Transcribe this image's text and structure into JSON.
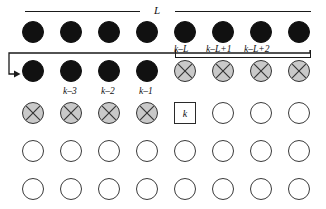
{
  "figure": {
    "name": "sequential-lattice-diagram",
    "grid": {
      "columns": 8,
      "rows": 5,
      "col_x": [
        33,
        71,
        109,
        147,
        185,
        223,
        261,
        299
      ],
      "row_y": [
        32,
        71,
        113,
        151,
        189
      ],
      "node_diameter": 22
    },
    "node_states": [
      [
        "filled",
        "filled",
        "filled",
        "filled",
        "filled",
        "filled",
        "filled",
        "filled"
      ],
      [
        "filled",
        "filled",
        "filled",
        "filled",
        "crossed",
        "crossed",
        "crossed",
        "crossed"
      ],
      [
        "crossed",
        "crossed",
        "crossed",
        "crossed",
        "current",
        "empty",
        "empty",
        "empty"
      ],
      [
        "empty",
        "empty",
        "empty",
        "empty",
        "empty",
        "empty",
        "empty",
        "empty"
      ],
      [
        "empty",
        "empty",
        "empty",
        "empty",
        "empty",
        "empty",
        "empty",
        "empty"
      ]
    ],
    "legend": {
      "filled": "processed-site",
      "crossed": "in-window-site",
      "empty": "unprocessed-site",
      "current": "current-site-k"
    }
  },
  "span_label": {
    "text": "L",
    "description": "window-length-brace-top"
  },
  "top_labels": [
    {
      "text": "k–L",
      "x": 185,
      "y": 49
    },
    {
      "text": "k–L+1",
      "x": 223,
      "y": 49
    },
    {
      "text": "k–L+2",
      "x": 261,
      "y": 49
    }
  ],
  "mid_labels": [
    {
      "text": "k–3",
      "x": 71,
      "y": 91
    },
    {
      "text": "k–2",
      "x": 109,
      "y": 91
    },
    {
      "text": "k–1",
      "x": 147,
      "y": 91
    }
  ],
  "current_cell": {
    "text": "k",
    "x": 185,
    "y": 113
  },
  "colors": {
    "filled": "#111111",
    "crossed_fill": "#c9c9c9",
    "crossed_stroke": "#333333",
    "empty_stroke": "#3a3a3a",
    "rule": "#1a1a1a",
    "background": "#ffffff"
  }
}
